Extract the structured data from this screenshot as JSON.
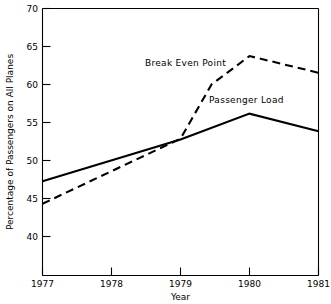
{
  "chart_data": {
    "type": "line",
    "title": "",
    "xlabel": "Year",
    "ylabel": "Percentage of Passengers on All Planes",
    "x": [
      1977,
      1978,
      1979,
      1980,
      1981
    ],
    "xlim": [
      1977,
      1981
    ],
    "ylim": [
      38,
      70
    ],
    "xticks": [
      "1977",
      "1978",
      "1979",
      "1980",
      "1981"
    ],
    "yticks": [
      "40",
      "45",
      "50",
      "55",
      "60",
      "65",
      "70"
    ],
    "grid": false,
    "legend": "inline-annotations",
    "series": [
      {
        "name": "Passenger Load",
        "style": "solid",
        "x": [
          1977,
          1979,
          1980,
          1981
        ],
        "values": [
          49.3,
          54.3,
          57.4,
          55.3
        ]
      },
      {
        "name": "Break Even Point",
        "style": "dashed",
        "x": [
          1977,
          1979,
          1979.45,
          1980,
          1981
        ],
        "values": [
          46.6,
          54.4,
          60.9,
          64.3,
          62.3
        ]
      }
    ],
    "annotations": [
      {
        "text": "Break Even Point",
        "x": 1979.0,
        "y": 62.6
      },
      {
        "text": "Passenger Load",
        "x": 1979.9,
        "y": 59.0
      }
    ]
  },
  "axes": {
    "y_axis_label": "Percentage of Passengers on All Planes",
    "x_axis_label": "Year",
    "y_tick_labels": [
      "70",
      "65",
      "60",
      "55",
      "50",
      "45",
      "40"
    ],
    "x_tick_labels": [
      "1977",
      "1978",
      "1979",
      "1980",
      "1981"
    ]
  },
  "annotations": {
    "break_even": "Break Even Point",
    "passenger_load": "Passenger Load"
  },
  "colors": {
    "ink": "#000000",
    "background": "#ffffff"
  }
}
